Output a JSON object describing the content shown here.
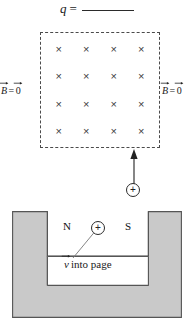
{
  "figure": {
    "title_prompt": {
      "symbol": "q",
      "equals": "=",
      "answer_blank": ""
    },
    "field_region": {
      "field_symbol": "×",
      "rows": 4,
      "cols": 4,
      "marks": [
        [
          "×",
          "×",
          "×",
          "×"
        ],
        [
          "×",
          "×",
          "×",
          "×"
        ],
        [
          "×",
          "×",
          "×",
          "×"
        ],
        [
          "×",
          "×",
          "×",
          "×"
        ]
      ]
    },
    "labels": {
      "b_left": {
        "base": "B",
        "equals": "=",
        "value": "0"
      },
      "b_right": {
        "base": "B",
        "equals": "=",
        "value": "0"
      },
      "pole_north": "N",
      "pole_south": "S",
      "velocity": {
        "base": "v",
        "text": "into page"
      }
    },
    "charges": {
      "upper_sign": "+",
      "gap_sign": "+"
    },
    "colors": {
      "magnet_fill": "#c9c9c9",
      "magnet_stroke": "#555555",
      "dash_stroke": "#4a4a4a",
      "ink": "#222222",
      "background": "#ffffff"
    }
  }
}
